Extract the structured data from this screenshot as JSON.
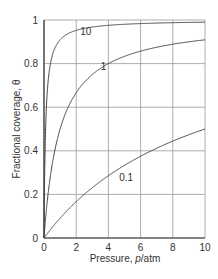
{
  "chart_data": {
    "type": "line",
    "title": "",
    "xlabel": "Pressure, p/atm",
    "ylabel": "Fractional coverage, θ",
    "xlim": [
      0,
      10
    ],
    "ylim": [
      0,
      1
    ],
    "grid": true,
    "x_ticks": [
      "0",
      "2",
      "4",
      "6",
      "8",
      "10"
    ],
    "y_ticks": [
      "0",
      "0.2",
      "0.4",
      "0.6",
      "0.8",
      "1"
    ],
    "legend": "inline curve labels",
    "series": [
      {
        "name": "10",
        "label_pos": [
          2.6,
          0.93
        ],
        "x": [
          0,
          0.1,
          0.2,
          0.3,
          0.5,
          0.75,
          1,
          1.5,
          2,
          3,
          4,
          5,
          6,
          7,
          8,
          9,
          10
        ],
        "values": [
          0,
          0.5,
          0.667,
          0.75,
          0.833,
          0.882,
          0.909,
          0.9375,
          0.952,
          0.968,
          0.976,
          0.98,
          0.984,
          0.986,
          0.988,
          0.989,
          0.99
        ]
      },
      {
        "name": "1",
        "label_pos": [
          3.7,
          0.77
        ],
        "x": [
          0,
          0.25,
          0.5,
          0.75,
          1,
          1.5,
          2,
          3,
          4,
          5,
          6,
          7,
          8,
          9,
          10
        ],
        "values": [
          0,
          0.2,
          0.333,
          0.429,
          0.5,
          0.6,
          0.667,
          0.75,
          0.8,
          0.833,
          0.857,
          0.875,
          0.889,
          0.9,
          0.909
        ]
      },
      {
        "name": "0.1",
        "label_pos": [
          5.1,
          0.26
        ],
        "x": [
          0,
          1,
          2,
          3,
          4,
          5,
          6,
          7,
          8,
          9,
          10
        ],
        "values": [
          0,
          0.091,
          0.167,
          0.231,
          0.286,
          0.333,
          0.375,
          0.412,
          0.444,
          0.474,
          0.5
        ]
      }
    ]
  },
  "labels": {
    "xlabel_prefix": "Pressure, ",
    "xlabel_var": "p",
    "xlabel_unit": "/atm",
    "ylabel": "Fractional coverage, θ"
  }
}
